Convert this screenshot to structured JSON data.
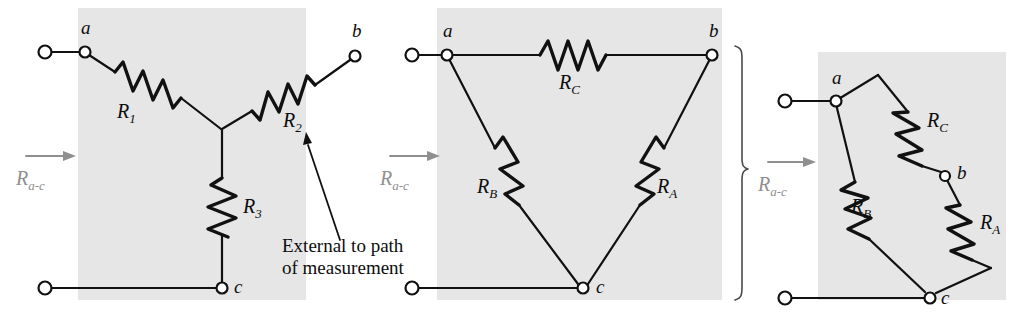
{
  "figure": {
    "background_color": "#ffffff",
    "panel_color": "#e6e6e6",
    "line_color": "#111111",
    "measure_label_color": "#8f8f8f"
  },
  "annotation": {
    "line1": "External to path",
    "line2": "of measurement"
  },
  "panels": [
    {
      "id": "wye",
      "kind": "wye",
      "measure_label": "R",
      "measure_sub": "a-c",
      "nodes": [
        {
          "name": "a",
          "label": "a"
        },
        {
          "name": "b",
          "label": "b"
        },
        {
          "name": "c",
          "label": "c"
        }
      ],
      "resistors": [
        {
          "name": "R1",
          "label": "R",
          "sub": "1"
        },
        {
          "name": "R2",
          "label": "R",
          "sub": "2"
        },
        {
          "name": "R3",
          "label": "R",
          "sub": "3"
        }
      ]
    },
    {
      "id": "delta",
      "kind": "delta",
      "measure_label": "R",
      "measure_sub": "a-c",
      "nodes": [
        {
          "name": "a",
          "label": "a"
        },
        {
          "name": "b",
          "label": "b"
        },
        {
          "name": "c",
          "label": "c"
        }
      ],
      "resistors": [
        {
          "name": "RC",
          "label": "R",
          "sub": "C"
        },
        {
          "name": "RB",
          "label": "R",
          "sub": "B"
        },
        {
          "name": "RA",
          "label": "R",
          "sub": "A"
        }
      ]
    },
    {
      "id": "series-parallel",
      "kind": "series-parallel",
      "measure_label": "R",
      "measure_sub": "a-c",
      "nodes": [
        {
          "name": "a",
          "label": "a"
        },
        {
          "name": "b",
          "label": "b"
        },
        {
          "name": "c",
          "label": "c"
        }
      ],
      "resistors": [
        {
          "name": "RC",
          "label": "R",
          "sub": "C"
        },
        {
          "name": "RB",
          "label": "R",
          "sub": "B"
        },
        {
          "name": "RA",
          "label": "R",
          "sub": "A"
        }
      ]
    }
  ]
}
